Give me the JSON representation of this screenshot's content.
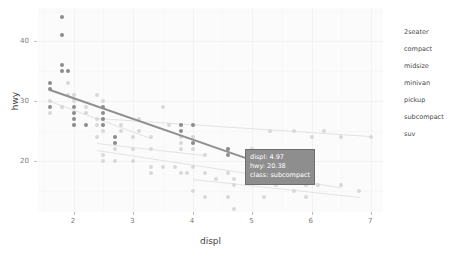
{
  "chart_data": {
    "type": "scatter",
    "title": "",
    "xlabel": "displ",
    "ylabel": "hwy",
    "xlim": [
      1.4,
      7.2
    ],
    "ylim": [
      11.5,
      45.5
    ],
    "xticks": [
      "2",
      "3",
      "4",
      "5",
      "6",
      "7"
    ],
    "yticks": [
      "20",
      "30",
      "40"
    ],
    "grid": true,
    "legend_position": "right",
    "legend_entries": [
      "2seater",
      "compact",
      "midsize",
      "minivan",
      "pickup",
      "subcompact",
      "suv"
    ],
    "highlighted_class": "subcompact",
    "series": [
      {
        "name": "subcompact",
        "highlighted": true,
        "points": [
          {
            "x": 1.6,
            "y": 33
          },
          {
            "x": 1.6,
            "y": 32
          },
          {
            "x": 1.6,
            "y": 29
          },
          {
            "x": 1.8,
            "y": 36
          },
          {
            "x": 1.8,
            "y": 35
          },
          {
            "x": 1.8,
            "y": 44
          },
          {
            "x": 1.8,
            "y": 41
          },
          {
            "x": 1.9,
            "y": 35
          },
          {
            "x": 2.0,
            "y": 29
          },
          {
            "x": 2.0,
            "y": 28
          },
          {
            "x": 2.0,
            "y": 27
          },
          {
            "x": 2.0,
            "y": 26
          },
          {
            "x": 2.2,
            "y": 26
          },
          {
            "x": 2.5,
            "y": 29
          },
          {
            "x": 2.5,
            "y": 28
          },
          {
            "x": 2.5,
            "y": 27
          },
          {
            "x": 2.5,
            "y": 26
          },
          {
            "x": 2.7,
            "y": 24
          },
          {
            "x": 2.7,
            "y": 23
          },
          {
            "x": 3.8,
            "y": 26
          },
          {
            "x": 3.8,
            "y": 25
          },
          {
            "x": 4.0,
            "y": 26
          },
          {
            "x": 4.0,
            "y": 23
          },
          {
            "x": 4.6,
            "y": 22
          },
          {
            "x": 4.6,
            "y": 21
          },
          {
            "x": 5.4,
            "y": 20
          }
        ],
        "fit": {
          "x1": 1.6,
          "y1": 32.0,
          "x2": 4.97,
          "y2": 20.38
        }
      },
      {
        "name": "other-classes",
        "highlighted": false,
        "points": [
          {
            "x": 1.8,
            "y": 29
          },
          {
            "x": 1.8,
            "y": 29
          },
          {
            "x": 2.0,
            "y": 31
          },
          {
            "x": 2.0,
            "y": 30
          },
          {
            "x": 2.0,
            "y": 26
          },
          {
            "x": 2.4,
            "y": 27
          },
          {
            "x": 2.4,
            "y": 26
          },
          {
            "x": 2.5,
            "y": 26
          },
          {
            "x": 2.5,
            "y": 25
          },
          {
            "x": 2.8,
            "y": 26
          },
          {
            "x": 2.8,
            "y": 25
          },
          {
            "x": 3.1,
            "y": 27
          },
          {
            "x": 3.1,
            "y": 25
          },
          {
            "x": 3.5,
            "y": 29
          },
          {
            "x": 3.6,
            "y": 26
          },
          {
            "x": 2.4,
            "y": 24
          },
          {
            "x": 3.0,
            "y": 24
          },
          {
            "x": 3.3,
            "y": 24
          },
          {
            "x": 3.8,
            "y": 24
          },
          {
            "x": 3.8,
            "y": 23
          },
          {
            "x": 4.0,
            "y": 24
          },
          {
            "x": 4.6,
            "y": 22
          },
          {
            "x": 5.0,
            "y": 22
          },
          {
            "x": 5.3,
            "y": 25
          },
          {
            "x": 5.7,
            "y": 25
          },
          {
            "x": 6.0,
            "y": 24
          },
          {
            "x": 6.2,
            "y": 25
          },
          {
            "x": 6.5,
            "y": 24
          },
          {
            "x": 7.0,
            "y": 24
          },
          {
            "x": 2.5,
            "y": 21
          },
          {
            "x": 2.5,
            "y": 20
          },
          {
            "x": 2.7,
            "y": 20
          },
          {
            "x": 3.0,
            "y": 20
          },
          {
            "x": 3.3,
            "y": 19
          },
          {
            "x": 3.3,
            "y": 18
          },
          {
            "x": 3.5,
            "y": 19
          },
          {
            "x": 3.7,
            "y": 19
          },
          {
            "x": 3.8,
            "y": 18
          },
          {
            "x": 3.9,
            "y": 18
          },
          {
            "x": 4.0,
            "y": 19
          },
          {
            "x": 4.2,
            "y": 18
          },
          {
            "x": 4.4,
            "y": 17
          },
          {
            "x": 4.6,
            "y": 18
          },
          {
            "x": 4.7,
            "y": 17
          },
          {
            "x": 4.7,
            "y": 16
          },
          {
            "x": 5.0,
            "y": 17
          },
          {
            "x": 5.2,
            "y": 17
          },
          {
            "x": 5.3,
            "y": 18
          },
          {
            "x": 5.4,
            "y": 16
          },
          {
            "x": 5.6,
            "y": 17
          },
          {
            "x": 5.7,
            "y": 17
          },
          {
            "x": 5.9,
            "y": 16
          },
          {
            "x": 6.1,
            "y": 16
          },
          {
            "x": 6.5,
            "y": 16
          },
          {
            "x": 6.8,
            "y": 15
          },
          {
            "x": 4.0,
            "y": 15
          },
          {
            "x": 4.2,
            "y": 14
          },
          {
            "x": 4.6,
            "y": 14
          },
          {
            "x": 4.7,
            "y": 12
          },
          {
            "x": 5.2,
            "y": 14
          },
          {
            "x": 5.7,
            "y": 15
          },
          {
            "x": 5.9,
            "y": 14
          },
          {
            "x": 3.0,
            "y": 22
          },
          {
            "x": 3.3,
            "y": 22
          },
          {
            "x": 3.8,
            "y": 22
          },
          {
            "x": 4.0,
            "y": 22
          },
          {
            "x": 4.2,
            "y": 21
          },
          {
            "x": 2.7,
            "y": 22
          },
          {
            "x": 1.9,
            "y": 33
          },
          {
            "x": 1.9,
            "y": 31
          },
          {
            "x": 2.2,
            "y": 29
          },
          {
            "x": 2.2,
            "y": 28
          },
          {
            "x": 2.4,
            "y": 31
          },
          {
            "x": 2.5,
            "y": 30
          },
          {
            "x": 1.6,
            "y": 30
          },
          {
            "x": 1.6,
            "y": 28
          }
        ],
        "fits": [
          {
            "x1": 1.6,
            "y1": 30.0,
            "x2": 3.3,
            "y2": 23.8
          },
          {
            "x1": 2.4,
            "y1": 27.2,
            "x2": 7.0,
            "y2": 24.2
          },
          {
            "x1": 2.4,
            "y1": 21.8,
            "x2": 6.5,
            "y2": 15.6
          },
          {
            "x1": 4.0,
            "y1": 17.0,
            "x2": 6.8,
            "y2": 14.0
          },
          {
            "x1": 2.4,
            "y1": 23.0,
            "x2": 4.2,
            "y2": 21.0
          }
        ]
      }
    ]
  },
  "axes": {
    "x_title": "displ",
    "y_title": "hwy",
    "x_tick_labels": [
      "2",
      "3",
      "4",
      "5",
      "6",
      "7"
    ],
    "y_tick_labels": [
      "40",
      "30",
      "20"
    ]
  },
  "legend": {
    "items": [
      {
        "label": "2seater"
      },
      {
        "label": "compact"
      },
      {
        "label": "midsize"
      },
      {
        "label": "minivan"
      },
      {
        "label": "pickup"
      },
      {
        "label": "subcompact"
      },
      {
        "label": "suv"
      }
    ]
  },
  "tooltip": {
    "displ_line": "displ: 4.97",
    "hwy_line": "hwy: 20.38",
    "class_line": "class: subcompact"
  },
  "colors": {
    "panel_background": "#fbfbfb",
    "page_background": "#ffffff",
    "highlight": "#8f8f8f",
    "dim": "#d8d8d8",
    "tooltip_background": "#8e8e8e",
    "tooltip_text": "#ffffff",
    "axis_text": "#7a7a7a"
  }
}
